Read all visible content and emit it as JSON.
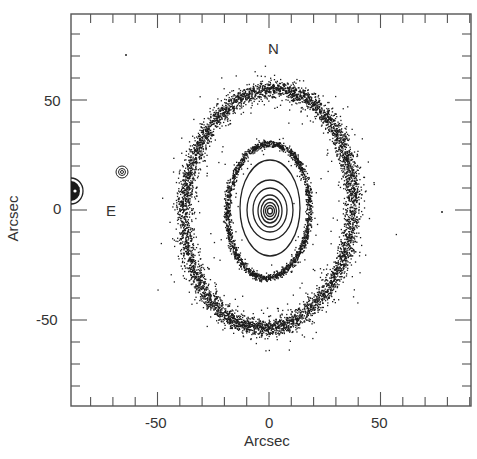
{
  "chart_data": {
    "type": "scatter",
    "title": "",
    "xlabel": "Arcsec",
    "ylabel": "Arcsec",
    "xlim": [
      -90,
      90
    ],
    "ylim": [
      -88,
      88
    ],
    "x_ticks_major": [
      -50,
      0,
      50
    ],
    "y_ticks_major": [
      -50,
      0,
      50
    ],
    "minor_tick_step": 10,
    "grid": false,
    "legend": null,
    "annotations": [
      {
        "text": "N",
        "x": 2,
        "y": 72
      },
      {
        "text": "E",
        "x": -71,
        "y": 0
      }
    ],
    "features": [
      {
        "name": "outer-ring",
        "kind": "dot-scatter ellipse",
        "center": [
          0,
          0
        ],
        "semi_major_arcsec": 54,
        "semi_minor_arcsec": 38,
        "orientation": "vertical, slight tilt"
      },
      {
        "name": "inner-ring",
        "kind": "dot-scatter ellipse",
        "center": [
          0,
          -1
        ],
        "semi_major_arcsec": 30,
        "semi_minor_arcsec": 19
      },
      {
        "name": "core-contours",
        "kind": "nested contour lines",
        "center": [
          1,
          -1
        ],
        "count": 8
      },
      {
        "name": "companion-star-1",
        "kind": "contour blob",
        "center": [
          -66,
          17
        ]
      },
      {
        "name": "companion-star-2",
        "kind": "filled contour blob",
        "center": [
          -88,
          8
        ]
      }
    ]
  },
  "labels": {
    "xlabel": "Arcsec",
    "ylabel": "Arcsec",
    "north": "N",
    "east": "E",
    "x_tick_neg50": "-50",
    "x_tick_0": "0",
    "x_tick_50": "50",
    "y_tick_50": "50",
    "y_tick_0": "0",
    "y_tick_neg50": "-50"
  },
  "colors": {
    "ink": "#1a1a1a",
    "frame": "#555555",
    "background": "#ffffff"
  }
}
